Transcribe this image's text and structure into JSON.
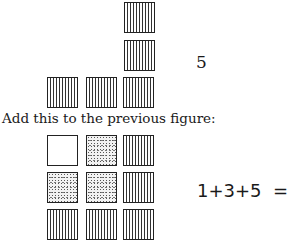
{
  "figure1": {
    "count_label": "5",
    "squares": [
      {
        "row": 0,
        "col": 2,
        "fill": "lined"
      },
      {
        "row": 1,
        "col": 2,
        "fill": "lined"
      },
      {
        "row": 2,
        "col": 0,
        "fill": "lined"
      },
      {
        "row": 2,
        "col": 1,
        "fill": "lined"
      },
      {
        "row": 2,
        "col": 2,
        "fill": "lined"
      }
    ]
  },
  "caption": "Add this to the previous figure:",
  "figure2": {
    "equation": "1+3+5  =  9",
    "grid": [
      [
        "blank",
        "dotted",
        "lined"
      ],
      [
        "dotted",
        "dotted",
        "lined"
      ],
      [
        "lined",
        "lined",
        "lined"
      ]
    ]
  }
}
